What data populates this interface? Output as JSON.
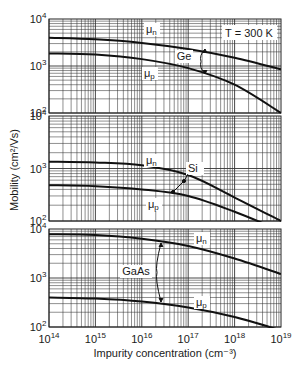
{
  "figure": {
    "ylabel": "Mobility (cm²/Vs)",
    "xlabel": "Impurity concentration (cm⁻³)",
    "temperature_label": "T = 300 K"
  },
  "axes": {
    "x_ticks": [
      "14",
      "15",
      "16",
      "17",
      "18",
      "19"
    ],
    "y_ticks": [
      "4",
      "3",
      "2"
    ]
  },
  "chart_data": [
    {
      "type": "line",
      "title": "Ge",
      "xlabel": "Impurity concentration (cm^-3)",
      "ylabel": "Mobility (cm^2/Vs)",
      "xscale": "log",
      "yscale": "log",
      "xlim": [
        100000000000000.0,
        1e+19
      ],
      "ylim": [
        100,
        10000
      ],
      "grid": true,
      "annotations": [
        "T = 300 K",
        "Ge"
      ],
      "x": [
        100000000000000.0,
        1000000000000000.0,
        1e+16,
        1e+17,
        1e+18,
        1e+19
      ],
      "series": [
        {
          "name": "μn",
          "values": [
            4000,
            3700,
            3100,
            2300,
            1500,
            850
          ]
        },
        {
          "name": "μp",
          "values": [
            1850,
            1750,
            1400,
            900,
            400,
            100
          ]
        }
      ]
    },
    {
      "type": "line",
      "title": "Si",
      "xlabel": "Impurity concentration (cm^-3)",
      "ylabel": "Mobility (cm^2/Vs)",
      "xscale": "log",
      "yscale": "log",
      "xlim": [
        100000000000000.0,
        1e+19
      ],
      "ylim": [
        100,
        10000
      ],
      "grid": true,
      "annotations": [
        "Si"
      ],
      "x": [
        100000000000000.0,
        1000000000000000.0,
        1e+16,
        1e+17,
        1e+18,
        1e+19
      ],
      "series": [
        {
          "name": "μn",
          "values": [
            1350,
            1300,
            1150,
            750,
            280,
            100
          ]
        },
        {
          "name": "μp",
          "values": [
            480,
            460,
            400,
            300,
            150,
            65
          ]
        }
      ]
    },
    {
      "type": "line",
      "title": "GaAs",
      "xlabel": "Impurity concentration (cm^-3)",
      "ylabel": "Mobility (cm^2/Vs)",
      "xscale": "log",
      "yscale": "log",
      "xlim": [
        100000000000000.0,
        1e+19
      ],
      "ylim": [
        100,
        10000
      ],
      "grid": true,
      "annotations": [
        "GaAs"
      ],
      "x": [
        100000000000000.0,
        1000000000000000.0,
        1e+16,
        1e+17,
        1e+18,
        1e+19
      ],
      "series": [
        {
          "name": "μn",
          "values": [
            7800,
            7500,
            6300,
            4500,
            2500,
            1200
          ]
        },
        {
          "name": "μp",
          "values": [
            400,
            380,
            330,
            250,
            160,
            85
          ]
        }
      ]
    }
  ],
  "panels": [
    {
      "name": "ge-panel",
      "material": "Ge",
      "mu_n_label": "μ",
      "mu_n_sub": "n",
      "mu_p_label": "μ",
      "mu_p_sub": "p"
    },
    {
      "name": "si-panel",
      "material": "Si",
      "mu_n_label": "μ",
      "mu_n_sub": "n",
      "mu_p_label": "μ",
      "mu_p_sub": "p"
    },
    {
      "name": "gaas-panel",
      "material": "GaAs",
      "mu_n_label": "μ",
      "mu_n_sub": "n",
      "mu_p_label": "μ",
      "mu_p_sub": "p"
    }
  ]
}
